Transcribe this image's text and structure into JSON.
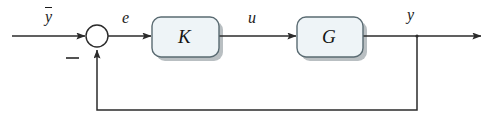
{
  "diagram": {
    "type": "block-diagram",
    "canvas": {
      "width": 495,
      "height": 122,
      "background": "#ffffff"
    },
    "style": {
      "line_color": "#2b2b2b",
      "block_fill": "#eef4f7",
      "block_border": "#5a6b72",
      "shadow_color": "#b9bfc2",
      "text_color": "#1a1a1a"
    },
    "blocks": [
      {
        "id": "controller",
        "label": "K",
        "role": "controller",
        "shape": "rounded-rectangle",
        "x": 152,
        "y": 17,
        "width": 67,
        "height": 40
      },
      {
        "id": "plant",
        "label": "G",
        "role": "plant",
        "shape": "rounded-rectangle",
        "x": 297,
        "y": 17,
        "width": 66,
        "height": 40
      }
    ],
    "summing_junction": {
      "id": "sum",
      "shape": "circle",
      "cx": 97,
      "cy": 36,
      "r": 11,
      "signs": [
        {
          "label": "−",
          "port": "bottom",
          "x": 72,
          "y": 58
        }
      ]
    },
    "takeoff_node": {
      "id": "output-node",
      "cx": 417,
      "cy": 36
    },
    "signals": [
      {
        "id": "reference",
        "label": "y",
        "overbar": true,
        "x": 45,
        "y": 7
      },
      {
        "id": "error",
        "label": "e",
        "x": 122,
        "y": 10
      },
      {
        "id": "control",
        "label": "u",
        "x": 248,
        "y": 10
      },
      {
        "id": "output",
        "label": "y",
        "x": 407,
        "y": 7
      }
    ],
    "feedback_path": {
      "from": "output-node",
      "to": "sum",
      "corner_bottom_y": 110,
      "left_x": 97,
      "right_x": 417,
      "sign": "negative"
    }
  }
}
